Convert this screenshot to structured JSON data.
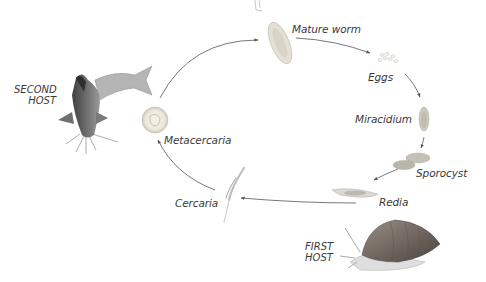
{
  "diagram": {
    "type": "life-cycle",
    "stages": [
      {
        "id": "mature-worm",
        "label": "Mature worm"
      },
      {
        "id": "eggs",
        "label": "Eggs"
      },
      {
        "id": "miracidium",
        "label": "Miracidium"
      },
      {
        "id": "sporocyst",
        "label": "Sporocyst"
      },
      {
        "id": "redia",
        "label": "Redia"
      },
      {
        "id": "cercaria",
        "label": "Cercaria"
      },
      {
        "id": "metacercaria",
        "label": "Metacercaria"
      }
    ],
    "hosts": {
      "first": {
        "line1": "FIRST",
        "line2": "HOST",
        "organism": "snail"
      },
      "second": {
        "line1": "SECOND",
        "line2": "HOST",
        "organism": "catfish"
      }
    },
    "flow": [
      "Mature worm",
      "Eggs",
      "Miracidium",
      "Sporocyst",
      "Redia",
      "Cercaria",
      "Metacercaria",
      "Mature worm"
    ],
    "colors": {
      "text": "#3a3a3a",
      "arrow": "#555555",
      "background": "#ffffff"
    }
  }
}
